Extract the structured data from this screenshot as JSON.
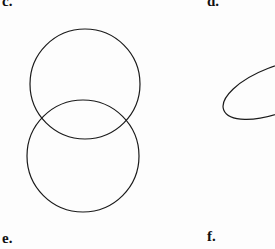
{
  "page": {
    "width": 275,
    "height": 249,
    "background_color": "#fdfdfd",
    "stroke_color": "#1a1a1a"
  },
  "labels": {
    "top_left": "c.",
    "top_right": "d.",
    "bottom_left": "e.",
    "bottom_right": "f."
  },
  "figures": {
    "two_overlapping_circles": {
      "label": "e.",
      "description": "two vertically overlapping circles forming a lens-shaped intersection",
      "shapes": [
        {
          "name": "upper-circle",
          "type": "circle",
          "cx": 85,
          "cy": 84,
          "r": 55,
          "stroke_width": 1.2
        },
        {
          "name": "lower-circle",
          "type": "circle",
          "cx": 83,
          "cy": 156,
          "r": 56,
          "stroke_width": 1.2
        }
      ]
    },
    "tilted_ellipse": {
      "label": "f.",
      "description": "a tilted ellipse entering from the right edge, clipped by the image border",
      "shapes": [
        {
          "name": "tilted-ellipse",
          "type": "ellipse",
          "cx": 276,
          "cy": 90,
          "rx": 56,
          "ry": 23,
          "rotation_deg": -21,
          "stroke_width": 1.2
        }
      ]
    }
  }
}
